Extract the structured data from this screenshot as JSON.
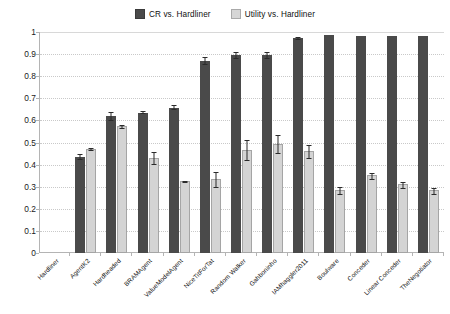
{
  "legend": {
    "position": "top-center",
    "entries": [
      {
        "label": "CR vs. Hardliner",
        "color": "#4a4a4a",
        "key": "cr"
      },
      {
        "label": "Utility vs. Hardliner",
        "color": "#d4d4d4",
        "key": "utility"
      }
    ]
  },
  "axis": {
    "y_ticks": [
      "0",
      "0.1",
      "0.2",
      "0.3",
      "0.4",
      "0.5",
      "0.6",
      "0.7",
      "0.8",
      "0.9",
      "1"
    ]
  },
  "chart_data": {
    "type": "bar",
    "title": "",
    "subtitle": "",
    "xlabel": "",
    "ylabel": "",
    "ylim": [
      0,
      1
    ],
    "ytick_step": 0.1,
    "grid": true,
    "legend_position": "top-center",
    "error_bars": true,
    "categories": [
      "Hardliner",
      "AgentK2",
      "Hardheaded",
      "BRAMAgent",
      "ValueModelAgent",
      "NiceTitForTat",
      "Random Walker",
      "Gahboninho",
      "IAMhaggler2011",
      "Boulware",
      "Conceder",
      "Linear Conceder",
      "TheNegotiator"
    ],
    "series": [
      {
        "name": "CR vs. Hardliner",
        "color": "#4a4a4a",
        "values": [
          0,
          0.435,
          0.618,
          0.635,
          0.658,
          0.87,
          0.895,
          0.895,
          0.972,
          0.985,
          0.982,
          0.982,
          0.982
        ],
        "errors": [
          0,
          0.012,
          0.022,
          0.006,
          0.012,
          0.018,
          0.016,
          0.016,
          0.006,
          0.0,
          0.0,
          0.0,
          0.0
        ]
      },
      {
        "name": "Utility vs. Hardliner",
        "color": "#d4d4d4",
        "values": [
          0,
          0.472,
          0.575,
          0.432,
          0.328,
          0.335,
          0.468,
          0.495,
          0.462,
          0.285,
          0.352,
          0.312,
          0.283
        ],
        "errors": [
          0,
          0.006,
          0.008,
          0.03,
          0.004,
          0.035,
          0.048,
          0.042,
          0.03,
          0.016,
          0.016,
          0.016,
          0.016
        ]
      }
    ]
  }
}
